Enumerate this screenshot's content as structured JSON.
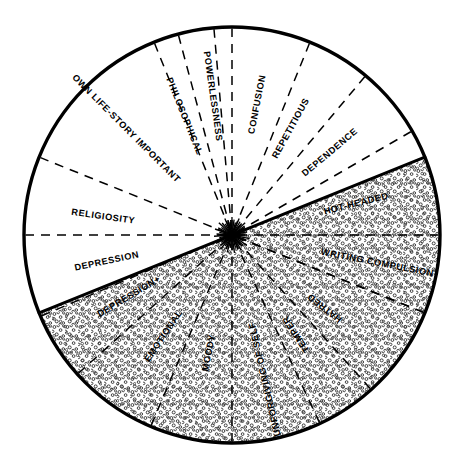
{
  "figure": {
    "name": "temporal-lobe-personality-traits-wheel",
    "type": "radial-sector-wheel",
    "geometry": {
      "center_x": 232,
      "center_y": 235,
      "radius": 208,
      "divider_angle_deg": 202,
      "outline_color": "#000000",
      "stipple_color": "#1a1a1a",
      "background_color": "#ffffff",
      "stipple_region_label": "upper stippled half",
      "plain_region_label": "lower plain half"
    },
    "sectors": [
      {
        "label": "OWN LIFE-STORY IMPORTANT",
        "start_deg": 112,
        "end_deg": 158,
        "shaded": true,
        "label_radius": 150,
        "label_angle_deg": 135,
        "boundary_style": "solid"
      },
      {
        "label": "PHILOSOPHICAL",
        "start_deg": 95,
        "end_deg": 112,
        "shaded": true,
        "label_radius": 128,
        "label_angle_deg": 112,
        "boundary_style": "dashed"
      },
      {
        "label": "POWERLESSNESS",
        "start_deg": 90,
        "end_deg": 105,
        "shaded": true,
        "label_radius": 140,
        "label_angle_deg": 98,
        "boundary_style": "dashed"
      },
      {
        "label": "CONFUSION",
        "start_deg": 68,
        "end_deg": 90,
        "shaded": true,
        "label_radius": 133,
        "label_angle_deg": 79,
        "boundary_style": "dashed"
      },
      {
        "label": "REPETITIOUS",
        "start_deg": 50,
        "end_deg": 68,
        "shaded": true,
        "label_radius": 122,
        "label_angle_deg": 61,
        "boundary_style": "dashed"
      },
      {
        "label": "DEPENDENCE",
        "start_deg": 30,
        "end_deg": 50,
        "shaded": true,
        "label_radius": 128,
        "label_angle_deg": 40,
        "boundary_style": "dashed"
      },
      {
        "label": "HOT-HEADED",
        "start_deg": 0,
        "end_deg": 30,
        "shaded": true,
        "label_radius": 128,
        "label_angle_deg": 14,
        "boundary_style": "dashed"
      },
      {
        "label": "WRITING COMPULSION",
        "start_deg": -22,
        "end_deg": 0,
        "shaded": true,
        "label_radius": 148,
        "label_angle_deg": -11,
        "boundary_style": "dashed"
      },
      {
        "label": "RELIGIOSITY",
        "start_deg": 158,
        "end_deg": 180,
        "shaded": false,
        "label_radius": 130,
        "label_angle_deg": 172,
        "boundary_style": "solid"
      },
      {
        "label": "DEPRESSION",
        "start_deg": 180,
        "end_deg": 203,
        "shaded": false,
        "label_radius": 128,
        "label_angle_deg": 192,
        "boundary_style": "dashed"
      },
      {
        "label": "DEPRESSION+",
        "start_deg": 203,
        "end_deg": 222,
        "shaded": false,
        "label_radius": 120,
        "label_angle_deg": 211,
        "boundary_style": "dashed"
      },
      {
        "label": "EMOTIONAL",
        "start_deg": 222,
        "end_deg": 247,
        "shaded": false,
        "label_radius": 122,
        "label_angle_deg": 236,
        "boundary_style": "dashed"
      },
      {
        "label": "MOODY",
        "start_deg": 247,
        "end_deg": 270,
        "shaded": false,
        "label_radius": 120,
        "label_angle_deg": 259,
        "boundary_style": "dashed"
      },
      {
        "label": "UNFORGIVING OF SELF",
        "start_deg": 270,
        "end_deg": 295,
        "shaded": false,
        "label_radius": 148,
        "label_angle_deg": 283,
        "boundary_style": "dashed"
      },
      {
        "label": "TEMPER",
        "start_deg": 295,
        "end_deg": 312,
        "shaded": false,
        "label_radius": 118,
        "label_angle_deg": 303,
        "boundary_style": "dashed"
      },
      {
        "label": "HATRED",
        "start_deg": 312,
        "end_deg": 338,
        "shaded": false,
        "label_radius": 118,
        "label_angle_deg": 322,
        "boundary_style": "dashed"
      }
    ]
  },
  "chart_data": {
    "type": "pie",
    "title": "",
    "xlabel": "",
    "ylabel": "",
    "legend_position": "none",
    "grid": false,
    "categories": [
      "OWN LIFE-STORY IMPORTANT",
      "PHILOSOPHICAL",
      "POWERLESSNESS",
      "CONFUSION",
      "REPETITIOUS",
      "DEPENDENCE",
      "HOT-HEADED",
      "WRITING COMPULSION",
      "HATRED",
      "TEMPER",
      "UNFORGIVING OF SELF",
      "MOODY",
      "EMOTIONAL",
      "DEPRESSION+",
      "DEPRESSION",
      "RELIGIOSITY"
    ],
    "values": [
      46,
      17,
      15,
      22,
      18,
      20,
      30,
      22,
      26,
      17,
      25,
      23,
      25,
      19,
      23,
      22
    ],
    "units": "degrees of arc"
  }
}
